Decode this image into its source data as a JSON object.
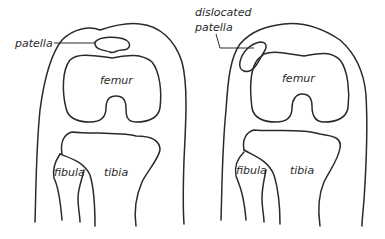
{
  "diagram": {
    "title": "",
    "panels": [
      {
        "id": "normal-knee",
        "labels": {
          "patella": "patella",
          "femur": "femur",
          "fibula": "fibula",
          "tibia": "tibia"
        }
      },
      {
        "id": "dislocated-knee",
        "labels": {
          "patella_line1": "dislocated",
          "patella_line2": "patella",
          "femur": "femur",
          "fibula": "fibula",
          "tibia": "tibia"
        }
      }
    ],
    "colors": {
      "stroke": "#2a2a2a",
      "background": "#ffffff"
    }
  }
}
